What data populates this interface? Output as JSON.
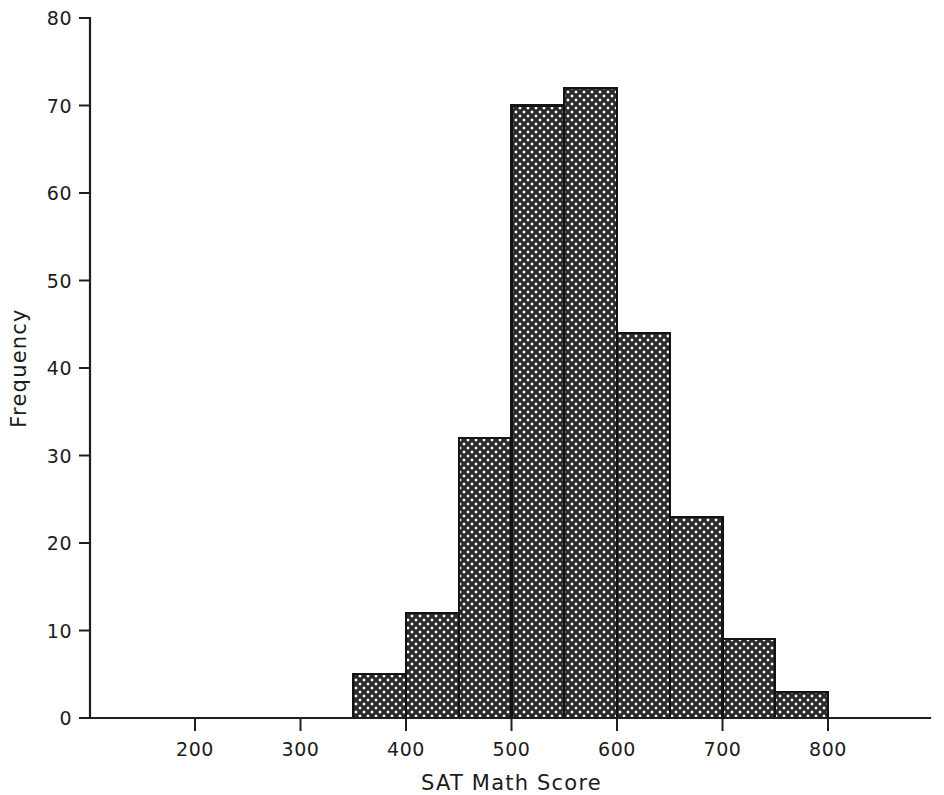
{
  "chart_data": {
    "type": "bar",
    "title": "",
    "subtitle": "",
    "xlabel": "SAT Math Score",
    "ylabel": "Frequency",
    "grid": false,
    "legend": null,
    "legend_position": "none",
    "xlim": [
      150,
      870
    ],
    "ylim": [
      0,
      80
    ],
    "x_ticks": [
      200,
      300,
      400,
      500,
      600,
      700,
      800
    ],
    "x_tick_labels": [
      "200",
      "300",
      "400",
      "500",
      "600",
      "700",
      "800"
    ],
    "y_ticks": [
      0,
      10,
      20,
      30,
      40,
      50,
      60,
      70,
      80
    ],
    "y_tick_labels": [
      "0",
      "10",
      "20",
      "30",
      "40",
      "50",
      "60",
      "70",
      "80"
    ],
    "bin_width": 50,
    "bin_edges": [
      350,
      400,
      450,
      500,
      550,
      600,
      650,
      700,
      750,
      800
    ],
    "categories": [
      "350-400",
      "400-450",
      "450-500",
      "500-550",
      "550-600",
      "600-650",
      "650-700",
      "700-750",
      "750-800"
    ],
    "values": [
      5,
      12,
      32,
      70,
      72,
      44,
      23,
      9,
      3
    ],
    "bar_fill_pattern": "crosshatch",
    "bar_fill_color": "#262626",
    "bar_edge_color": "#141414",
    "annotations": []
  },
  "axis": {
    "x_title": "SAT Math Score",
    "y_title": "Frequency"
  }
}
